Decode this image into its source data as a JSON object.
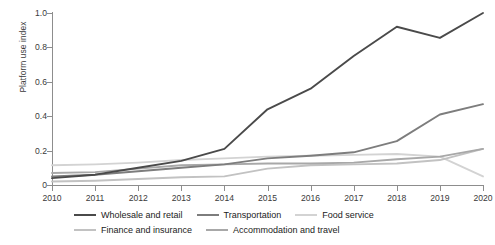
{
  "chart_data": {
    "type": "line",
    "title": "",
    "xlabel": "",
    "ylabel": "Platform use index",
    "x": [
      2010,
      2011,
      2012,
      2013,
      2014,
      2015,
      2016,
      2017,
      2018,
      2019,
      2020
    ],
    "xtick_labels": [
      "2010",
      "2011",
      "2012",
      "2013",
      "2014",
      "2015",
      "2016",
      "2017",
      "2018",
      "2019",
      "2020"
    ],
    "ytick_labels": [
      "0",
      "0.2",
      "0.4",
      "0.6",
      "0.8",
      "1.0"
    ],
    "ytick_values": [
      0,
      0.2,
      0.4,
      0.6,
      0.8,
      1.0
    ],
    "ylim": [
      0,
      1.0
    ],
    "xlim": [
      2010,
      2020
    ],
    "grid": false,
    "legend_position": "below",
    "series": [
      {
        "name": "Wholesale and retail",
        "color": "#4a4a4a",
        "width": 1.9,
        "values": [
          0.04,
          0.06,
          0.1,
          0.14,
          0.21,
          0.44,
          0.56,
          0.75,
          0.92,
          0.855,
          1.0
        ]
      },
      {
        "name": "Transportation",
        "color": "#7d7d7d",
        "width": 1.9,
        "values": [
          0.05,
          0.06,
          0.08,
          0.1,
          0.12,
          0.155,
          0.17,
          0.19,
          0.255,
          0.41,
          0.47
        ]
      },
      {
        "name": "Food service",
        "color": "#d3d3d3",
        "width": 1.9,
        "values": [
          0.115,
          0.12,
          0.13,
          0.145,
          0.155,
          0.165,
          0.17,
          0.175,
          0.18,
          0.165,
          0.05
        ]
      },
      {
        "name": "Finance and insurance",
        "color": "#c2c2c2",
        "width": 1.9,
        "values": [
          0.02,
          0.025,
          0.035,
          0.045,
          0.05,
          0.095,
          0.115,
          0.12,
          0.125,
          0.145,
          0.21
        ]
      },
      {
        "name": "Accommodation and travel",
        "color": "#a8a8a8",
        "width": 1.9,
        "values": [
          0.07,
          0.075,
          0.095,
          0.115,
          0.12,
          0.125,
          0.125,
          0.13,
          0.15,
          0.165,
          0.21
        ]
      }
    ]
  },
  "legend": {
    "row1": [
      "Wholesale and retail",
      "Transportation",
      "Food service"
    ],
    "row2": [
      "Finance and insurance",
      "Accommodation and travel"
    ]
  }
}
